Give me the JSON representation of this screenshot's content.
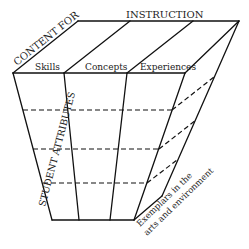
{
  "diagram": {
    "title_top_left": "CONTENT FOR",
    "title_top_right": "INSTRUCTION",
    "columns": [
      {
        "label": "Skills"
      },
      {
        "label": "Concepts"
      },
      {
        "label": "Experiences"
      }
    ],
    "side_label": "STUDENT ATTRIBUTES",
    "bottom_label_line1": "Exemplars in the",
    "bottom_label_line2": "arts and environment",
    "rows_count": 4,
    "colors": {
      "line": "#111111",
      "text": "#222222",
      "background": "#ffffff"
    }
  }
}
